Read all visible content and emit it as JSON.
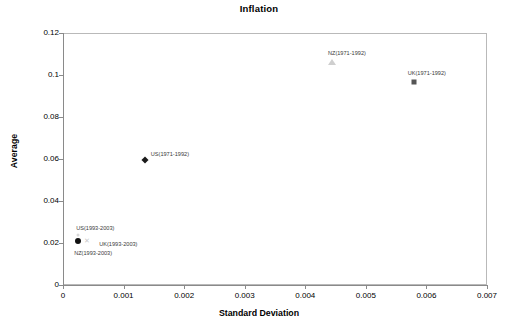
{
  "chart_data": {
    "type": "scatter",
    "title": "Inflation",
    "xlabel": "Standard Deviation",
    "ylabel": "Average",
    "xlim": [
      0,
      0.007
    ],
    "ylim": [
      0,
      0.12
    ],
    "xticks": [
      "0",
      "0.001",
      "0.002",
      "0.003",
      "0.004",
      "0.005",
      "0.006",
      "0.007"
    ],
    "xtick_values": [
      0,
      0.001,
      0.002,
      0.003,
      0.004,
      0.005,
      0.006,
      0.007
    ],
    "yticks": [
      "0",
      "0.02",
      "0.04",
      "0.06",
      "0.08",
      "0.1",
      "0.12"
    ],
    "ytick_values": [
      0,
      0.02,
      0.04,
      0.06,
      0.08,
      0.1,
      0.12
    ],
    "grid": false,
    "legend": "none",
    "points": [
      {
        "name": "US(1971-1992)",
        "x": 0.00135,
        "y": 0.0595,
        "marker": "diamond",
        "color": "#1a1a1a",
        "label_dx": 6,
        "label_dy": -9
      },
      {
        "name": "NZ(1971-1992)",
        "x": 0.00444,
        "y": 0.1063,
        "marker": "triangle",
        "color": "#cfcfcf",
        "label_dx": -4,
        "label_dy": -12
      },
      {
        "name": "UK(1971-1992)",
        "x": 0.00579,
        "y": 0.0967,
        "marker": "square",
        "color": "#555555",
        "label_dx": -6,
        "label_dy": -12
      },
      {
        "name": "US(1993-2003)",
        "x": 0.00025,
        "y": 0.0237,
        "marker": "dot-small",
        "color": "#d8d8d8",
        "label_dx": -2,
        "label_dy": -10
      },
      {
        "name": "UK(1993-2003)",
        "x": 0.0004,
        "y": 0.0216,
        "marker": "cross",
        "color": "#c9c9c9",
        "label_dx": 12,
        "label_dy": 1
      },
      {
        "name": "NZ(1993-2003)",
        "x": 0.00025,
        "y": 0.0209,
        "marker": "circle",
        "color": "#111111",
        "label_dx": -4,
        "label_dy": 9
      }
    ]
  }
}
